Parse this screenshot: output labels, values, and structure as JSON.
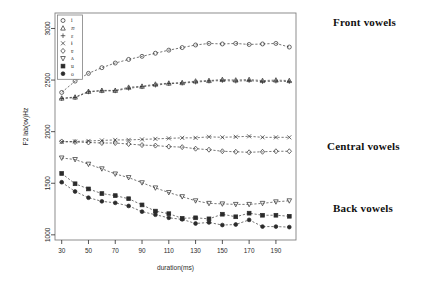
{
  "figure": {
    "background": "#ffffff",
    "plot_box": {
      "x": 55,
      "y": 13,
      "width": 241,
      "height": 227
    },
    "frame_color": "#808080",
    "ink_color": "#2b2b2b"
  },
  "annotations": {
    "front_vowels": "Front vowels",
    "central_vowels": "Central vowels",
    "back_vowels": "Back vowels"
  },
  "chart_data": {
    "type": "line",
    "title": "",
    "xlabel": "duration(ms)",
    "ylabel": "F2 lab(ov)Hz",
    "xlim": [
      25,
      205
    ],
    "ylim": [
      950,
      3150
    ],
    "xticks": [
      30,
      50,
      70,
      90,
      110,
      130,
      150,
      170,
      190
    ],
    "yticks": [
      1000,
      1500,
      2000,
      2500,
      3000
    ],
    "grid": false,
    "legend_position": "top-left-inside",
    "x": [
      30,
      40,
      50,
      60,
      70,
      80,
      90,
      100,
      110,
      120,
      130,
      140,
      150,
      160,
      170,
      180,
      190,
      200
    ],
    "series": [
      {
        "name": "i",
        "group": "front",
        "marker": "circle-open",
        "values": [
          2380,
          2490,
          2565,
          2620,
          2665,
          2700,
          2730,
          2760,
          2790,
          2815,
          2840,
          2855,
          2850,
          2855,
          2845,
          2850,
          2855,
          2820
        ]
      },
      {
        "name": "æ",
        "group": "front",
        "marker": "triangle-up-open",
        "values": [
          2325,
          2335,
          2390,
          2400,
          2400,
          2430,
          2440,
          2460,
          2470,
          2475,
          2490,
          2495,
          2505,
          2500,
          2505,
          2495,
          2500,
          2495
        ]
      },
      {
        "name": "ɛ",
        "group": "front",
        "marker": "plus",
        "values": [
          2320,
          2330,
          2385,
          2395,
          2395,
          2420,
          2435,
          2450,
          2465,
          2470,
          2480,
          2490,
          2495,
          2490,
          2495,
          2485,
          2490,
          2485
        ]
      },
      {
        "name": "ɨ",
        "group": "central",
        "marker": "cross",
        "values": [
          1900,
          1905,
          1910,
          1915,
          1920,
          1920,
          1925,
          1930,
          1935,
          1940,
          1940,
          1950,
          1945,
          1950,
          1955,
          1945,
          1945,
          1945
        ]
      },
      {
        "name": "ɐ",
        "group": "central",
        "marker": "diamond-open",
        "values": [
          1905,
          1900,
          1895,
          1890,
          1890,
          1880,
          1870,
          1865,
          1855,
          1850,
          1835,
          1825,
          1810,
          1805,
          1800,
          1805,
          1810,
          1810
        ]
      },
      {
        "name": "ʌ",
        "group": "back",
        "marker": "triangle-down-open",
        "values": [
          1745,
          1730,
          1685,
          1640,
          1590,
          1555,
          1505,
          1455,
          1410,
          1370,
          1330,
          1305,
          1300,
          1295,
          1295,
          1305,
          1320,
          1330
        ]
      },
      {
        "name": "u",
        "group": "back",
        "marker": "square-filled",
        "values": [
          1595,
          1495,
          1445,
          1400,
          1380,
          1350,
          1290,
          1230,
          1205,
          1160,
          1165,
          1155,
          1200,
          1175,
          1210,
          1190,
          1190,
          1180
        ]
      },
      {
        "name": "o",
        "group": "back",
        "marker": "circle-filled",
        "values": [
          1510,
          1420,
          1360,
          1325,
          1310,
          1280,
          1225,
          1195,
          1165,
          1150,
          1110,
          1120,
          1095,
          1100,
          1145,
          1080,
          1080,
          1075
        ]
      }
    ]
  }
}
